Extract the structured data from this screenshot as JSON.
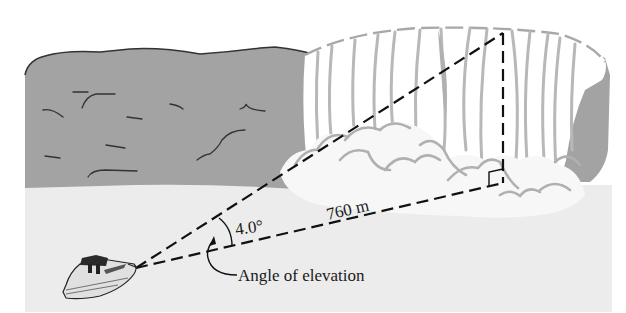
{
  "figure": {
    "type": "trigonometry-illustration"
  },
  "labels": {
    "angle_value": "4.0°",
    "distance": "760 m",
    "angle_caption": "Angle of elevation"
  },
  "geometry": {
    "observer": "boat",
    "target": "top of waterfall",
    "angle_deg": 4.0,
    "horizontal_distance_m": 760,
    "right_angle_marker": true
  },
  "colors": {
    "cliff": "#a3a3a3",
    "water": "#ececec",
    "falls": "#ffffff",
    "falls_streaks": "#b5b5b5",
    "spray": "#f5f5f5",
    "spray_outline": "#b0b0b0",
    "lines": "#111111"
  }
}
